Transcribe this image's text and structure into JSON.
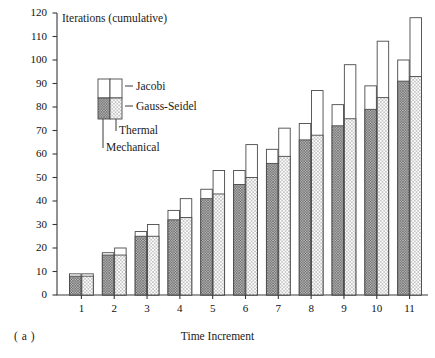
{
  "figure": {
    "caption": "( a )",
    "y_axis_title": "Iterations (cumulative)",
    "x_axis_title": "Time Increment"
  },
  "legend": {
    "jacobi": "Jacobi",
    "gauss_seidel": "Gauss-Seidel",
    "thermal": "Thermal",
    "mechanical": "Mechanical"
  },
  "colors": {
    "axis": "#3a3a3a",
    "bar_outline": "#4a4a4a",
    "mechanical_fill": "#8a8a8a",
    "thermal_fill": "#cfcfcf",
    "jacobi_fill": "#ffffff"
  },
  "chart_data": {
    "type": "bar",
    "title": "",
    "subtitle": "",
    "xlabel": "Time Increment",
    "ylabel": "Iterations (cumulative)",
    "ylim": [
      0,
      120
    ],
    "ytick_step": 10,
    "yticks": [
      0,
      10,
      20,
      30,
      40,
      50,
      60,
      70,
      80,
      90,
      100,
      110,
      120
    ],
    "grid": false,
    "legend_position": "inside-upper-left",
    "categories": [
      "1",
      "2",
      "3",
      "4",
      "5",
      "6",
      "7",
      "8",
      "9",
      "10",
      "11"
    ],
    "note": "Each time increment has two adjacent stacked bars: left = Mechanical, right = Thermal. Lower (dotted) segment = Gauss-Seidel, upper (white) segment extends to the Jacobi total.",
    "series": [
      {
        "name": "Mechanical Gauss-Seidel",
        "values": [
          8,
          17,
          25,
          32,
          41,
          47,
          56,
          66,
          72,
          79,
          91
        ]
      },
      {
        "name": "Mechanical Jacobi",
        "values": [
          9,
          18,
          27,
          36,
          45,
          53,
          62,
          73,
          81,
          89,
          100
        ]
      },
      {
        "name": "Thermal Gauss-Seidel",
        "values": [
          8,
          17,
          25,
          33,
          43,
          50,
          59,
          68,
          75,
          84,
          93
        ]
      },
      {
        "name": "Thermal Jacobi",
        "values": [
          9,
          20,
          30,
          41,
          53,
          64,
          71,
          87,
          98,
          108,
          118
        ]
      }
    ]
  }
}
